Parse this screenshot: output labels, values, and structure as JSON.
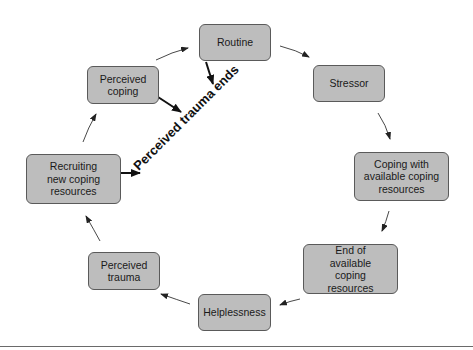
{
  "diagram": {
    "type": "cycle",
    "nodes": [
      {
        "id": "routine",
        "label": "Routine"
      },
      {
        "id": "stressor",
        "label": "Stressor"
      },
      {
        "id": "coping_available",
        "label": "Coping with available coping resources"
      },
      {
        "id": "end_resources",
        "label": "End of available coping resources"
      },
      {
        "id": "helplessness",
        "label": "Helplessness"
      },
      {
        "id": "perceived_trauma",
        "label": "Perceived trauma"
      },
      {
        "id": "recruiting",
        "label": "Recruiting new coping resources"
      },
      {
        "id": "perceived_coping",
        "label": "Perceived coping"
      }
    ],
    "edges": [
      {
        "from": "routine",
        "to": "stressor"
      },
      {
        "from": "stressor",
        "to": "coping_available"
      },
      {
        "from": "coping_available",
        "to": "end_resources"
      },
      {
        "from": "end_resources",
        "to": "helplessness"
      },
      {
        "from": "helplessness",
        "to": "perceived_trauma"
      },
      {
        "from": "perceived_trauma",
        "to": "recruiting"
      },
      {
        "from": "recruiting",
        "to": "perceived_coping"
      },
      {
        "from": "perceived_coping",
        "to": "routine"
      },
      {
        "from": "routine",
        "to": "trauma_ends_label",
        "style": "bold"
      },
      {
        "from": "perceived_coping",
        "to": "trauma_ends_label",
        "style": "bold"
      },
      {
        "from": "recruiting",
        "to": "trauma_ends_label",
        "style": "bold"
      }
    ],
    "center_label": "Perceived trauma ends"
  },
  "colors": {
    "box_fill": "#bdbdbd",
    "box_border": "#5a5a5a",
    "arrow": "#222222"
  }
}
